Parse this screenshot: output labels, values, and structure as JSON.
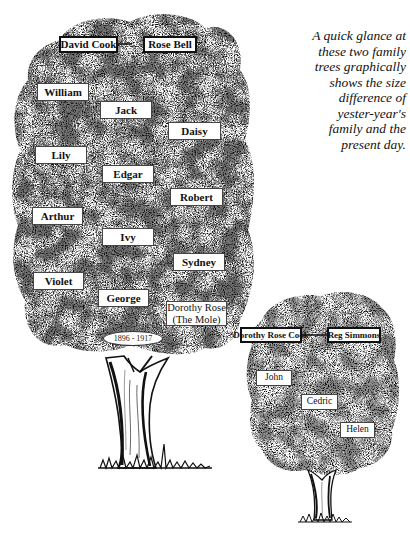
{
  "caption": {
    "lines": [
      "A quick glance at",
      "these two family",
      "trees graphically",
      "shows the size",
      "difference of",
      "yester-year's",
      "family and the",
      "present day."
    ]
  },
  "large_tree": {
    "parents": {
      "father": "David Cook",
      "mother": "Rose Bell"
    },
    "children": [
      {
        "name": "William"
      },
      {
        "name": "Jack"
      },
      {
        "name": "Daisy"
      },
      {
        "name": "Lily"
      },
      {
        "name": "Edgar"
      },
      {
        "name": "Robert"
      },
      {
        "name": "Arthur"
      },
      {
        "name": "Ivy"
      },
      {
        "name": "Sydney"
      },
      {
        "name": "Violet"
      },
      {
        "name": "George"
      },
      {
        "name_line1": "Dorothy Rose",
        "name_line2": "(The Mole)"
      }
    ],
    "dates": "1896 - 1917"
  },
  "small_tree": {
    "parents": {
      "mother": "Dorothy Rose Cook",
      "father": "Reg Simmons"
    },
    "children": [
      {
        "name": "John"
      },
      {
        "name": "Cedric"
      },
      {
        "name": "Helen"
      }
    ]
  },
  "colors": {
    "ink": "#111111",
    "paper": "#ffffff"
  }
}
